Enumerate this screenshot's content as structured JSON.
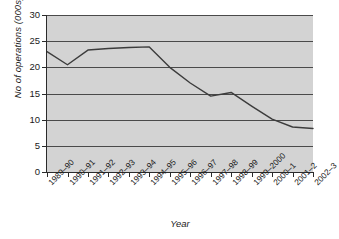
{
  "chart_data": {
    "type": "line",
    "title": "",
    "xlabel": "Year",
    "ylabel": "No of operations (000s)",
    "categories": [
      "1989–90",
      "1990–91",
      "1991–92",
      "1992–93",
      "1993–94",
      "1994–95",
      "1995–96",
      "1996–97",
      "1997–98",
      "1998–99",
      "1999–2000",
      "2000–1",
      "2001–2",
      "2002–3"
    ],
    "values": [
      23.0,
      20.5,
      23.3,
      23.6,
      23.8,
      23.9,
      20.0,
      17.0,
      14.5,
      15.2,
      12.6,
      10.1,
      8.6,
      8.3
    ],
    "yticks": [
      0,
      5,
      10,
      15,
      20,
      25,
      30
    ],
    "ytick_labels": [
      "0",
      "5",
      "10",
      "15",
      "20",
      "25",
      "30"
    ],
    "ylim": [
      0,
      30
    ],
    "grid": true,
    "legend": false,
    "legend_position": "none",
    "series_color": "#3c3c3c",
    "plot_background": "#d3d3d3",
    "grid_color": "#4a4a4a",
    "axis_color": "#2b2b2b"
  }
}
